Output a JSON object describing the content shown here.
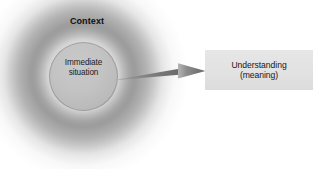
{
  "diagram": {
    "title": "Context",
    "width": 319,
    "height": 169,
    "background_color": "#ffffff",
    "context": {
      "label": "Context",
      "glow_color": "#808080"
    },
    "inner_circle": {
      "label_line1": "Immediate",
      "label_line2": "situation",
      "fill_color": "#c3c3c3",
      "border_color": "#8a8a8a"
    },
    "arrow": {
      "name": "leads-to-arrow",
      "color_start": "#9a9a9a",
      "color_end": "#6e6e6e",
      "direction": "left-to-right"
    },
    "understanding_box": {
      "label_line1": "Understanding",
      "label_line2": "(meaning)",
      "fill_color": "#e3e3e3"
    }
  }
}
